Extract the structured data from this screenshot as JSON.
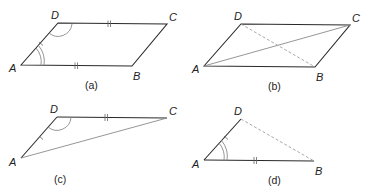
{
  "panels": [
    {
      "id": "a",
      "caption": "(a)",
      "shape": "parallelogram ABCD",
      "vertices": {
        "A": "A",
        "B": "B",
        "C": "C",
        "D": "D"
      },
      "marks": [
        "AB and DC equal (double tick)",
        "AD single tick",
        "angle A double arc",
        "angle D single arc"
      ]
    },
    {
      "id": "b",
      "caption": "(b)",
      "shape": "parallelogram ABCD with diagonal AC solid and diagonal DB dashed",
      "vertices": {
        "A": "A",
        "B": "B",
        "C": "C",
        "D": "D"
      }
    },
    {
      "id": "c",
      "caption": "(c)",
      "shape": "triangle ADC",
      "vertices": {
        "A": "A",
        "C": "C",
        "D": "D"
      },
      "marks": [
        "DC double tick",
        "AD single tick",
        "angle D single arc"
      ]
    },
    {
      "id": "d",
      "caption": "(d)",
      "shape": "triangle ABD with DB dashed",
      "vertices": {
        "A": "A",
        "B": "B",
        "D": "D"
      },
      "marks": [
        "AB double tick",
        "AD single tick",
        "angle A double arc"
      ]
    }
  ]
}
